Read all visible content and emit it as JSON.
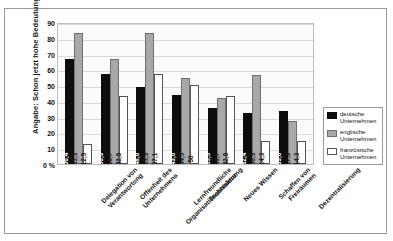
{
  "chart_data": {
    "type": "bar",
    "title": "",
    "xlabel": "",
    "ylabel": "Angabe: Schon jetzt hohe Bedeutung",
    "ylim": [
      0,
      90
    ],
    "yticks": [
      "0 %",
      "10",
      "20",
      "30",
      "40",
      "50",
      "60",
      "70",
      "80",
      "90"
    ],
    "grid": true,
    "legend_position": "right",
    "categories": [
      "Delegation von\nVerantwortung",
      "Offenheit des\nUnternehmens",
      "Lernfreundliche\nOrganisationsstruktur",
      "Technisierung",
      "Neues Wissen",
      "Schaffen von\nFreiräumen",
      "Dezentralisierung"
    ],
    "categories_lines": [
      [
        "Delegation von",
        "Verantwortung"
      ],
      [
        "Offenheit des",
        "Unternehmens"
      ],
      [
        "Lernfreundliche",
        "Organisationsstruktur"
      ],
      [
        "Technisierung"
      ],
      [
        "Neues Wissen"
      ],
      [
        "Schaffen von",
        "Freiräumen"
      ],
      [
        "Dezentralisierung"
      ]
    ],
    "series": [
      {
        "name": "deutsche Unternehmen",
        "name_lines": [
          "deutsche",
          "Unternehmen"
        ],
        "color": "#0d0d0d",
        "values": [
          66.4,
          56.9,
          48.6,
          43.6,
          35.5,
          32.4,
          33.6
        ],
        "labels": [
          "66,4",
          "56,9",
          "48,6",
          "43,6",
          "35,5",
          "32,4",
          "33,6"
        ]
      },
      {
        "name": "englische Unternehmen",
        "name_lines": [
          "englische",
          "Unternehmen"
        ],
        "color": "#a8a8a8",
        "values": [
          83.3,
          66.7,
          83.3,
          54.5,
          41.7,
          56.3,
          27.3
        ],
        "labels": [
          "83,3",
          "66,7",
          "83,3",
          "54,5",
          "41,7",
          "56,3",
          "27,3"
        ]
      },
      {
        "name": "französische Unternehmen",
        "name_lines": [
          "französische",
          "Unternehmen"
        ],
        "color": "#ffffff",
        "values": [
          12.5,
          42.9,
          57.1,
          50.0,
          42.9,
          14.3,
          14.3
        ],
        "labels": [
          "12,5",
          "42,9",
          "57,1",
          "50",
          "42,9",
          "14,3",
          "14,3"
        ]
      }
    ]
  }
}
